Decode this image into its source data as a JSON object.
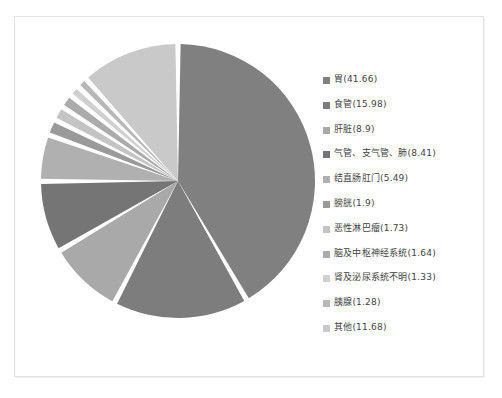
{
  "chart_data": {
    "type": "pie",
    "title": "",
    "unit": "%",
    "legend_position": "right",
    "start_angle_deg": 0,
    "direction": "clockwise",
    "categories": [
      "胃",
      "食管",
      "肝脏",
      "气管、支气管、肺",
      "结直肠肛门",
      "膀胱",
      "恶性淋巴瘤",
      "脑及中枢神经系统",
      "肾及泌尿系统不明",
      "胰腺",
      "其他"
    ],
    "values": [
      41.66,
      15.98,
      8.9,
      8.41,
      5.49,
      1.9,
      1.73,
      1.64,
      1.33,
      1.28,
      11.68
    ],
    "colors": [
      "#808080",
      "#7d7d7d",
      "#a9a9a9",
      "#757575",
      "#b0b0b0",
      "#9a9a9a",
      "#c4c4c4",
      "#ababab",
      "#d0d0d0",
      "#b8b8b8",
      "#c9c9c9"
    ],
    "slice_gap_deg": 2.2,
    "labels": [
      "胃(41.66)",
      "食管(15.98)",
      "肝脏(8.9)",
      "气管、支气管、肺(8.41)",
      "结直肠肛门(5.49)",
      "膀胱(1.9)",
      "恶性淋巴瘤(1.73)",
      "脑及中枢神经系统(1.64)",
      "肾及泌尿系统不明(1.33)",
      "胰腺(1.28)",
      "其他(11.68)"
    ]
  },
  "legend": {
    "items": [
      {
        "label": "胃(41.66)",
        "color": "#808080"
      },
      {
        "label": "食管(15.98)",
        "color": "#7d7d7d"
      },
      {
        "label": "肝脏(8.9)",
        "color": "#a9a9a9"
      },
      {
        "label": "气管、支气管、肺(8.41)",
        "color": "#757575"
      },
      {
        "label": "结直肠肛门(5.49)",
        "color": "#b0b0b0"
      },
      {
        "label": "膀胱(1.9)",
        "color": "#9a9a9a"
      },
      {
        "label": "恶性淋巴瘤(1.73)",
        "color": "#c4c4c4"
      },
      {
        "label": "脑及中枢神经系统(1.64)",
        "color": "#ababab"
      },
      {
        "label": "肾及泌尿系统不明(1.33)",
        "color": "#d0d0d0"
      },
      {
        "label": "胰腺(1.28)",
        "color": "#b8b8b8"
      },
      {
        "label": "其他(11.68)",
        "color": "#c9c9c9"
      }
    ]
  },
  "frame": {
    "border_color": "#e3e3e3",
    "background": "#ffffff"
  }
}
